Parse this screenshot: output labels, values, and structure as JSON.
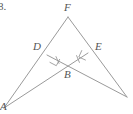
{
  "figure": {
    "problem_number": "8.",
    "background_color": "#ffffff",
    "line_color": "#9a9a9a",
    "label_color": "#555555",
    "width": 133,
    "height": 114,
    "vertices": [
      {
        "name": "F",
        "label": "F",
        "x": 68,
        "y": 17,
        "label_x": 64,
        "label_y": 2
      },
      {
        "name": "D",
        "label": "D",
        "x": 47,
        "y": 55,
        "label_x": 33,
        "label_y": 41
      },
      {
        "name": "E",
        "label": "E",
        "x": 88,
        "y": 53,
        "label_x": 95,
        "label_y": 41
      },
      {
        "name": "B",
        "label": "B",
        "x": 68,
        "y": 65,
        "label_x": 64,
        "label_y": 69
      },
      {
        "name": "A",
        "label": "A",
        "x": 4,
        "y": 108,
        "label_x": 0,
        "label_y": 101
      },
      {
        "name": "G",
        "label": "",
        "x": 127,
        "y": 97,
        "label_x": 124,
        "label_y": 90
      }
    ],
    "segments": [
      {
        "name": "segment-F-A",
        "from": "F",
        "to": "A"
      },
      {
        "name": "segment-F-G",
        "from": "F",
        "to": "G"
      },
      {
        "name": "segment-A-E",
        "from": "A",
        "to": "E"
      },
      {
        "name": "segment-G-D",
        "from": "G",
        "to": "D"
      }
    ],
    "right_angle_marks": [
      {
        "name": "right-angle-at-D",
        "at": "D",
        "size": 8
      },
      {
        "name": "right-angle-at-E",
        "at": "E",
        "size": 8
      }
    ],
    "tick_marks": [
      {
        "name": "tick-on-DB",
        "segment": "D-B",
        "count": 1
      },
      {
        "name": "tick-on-EB",
        "segment": "E-B",
        "count": 1
      }
    ]
  }
}
